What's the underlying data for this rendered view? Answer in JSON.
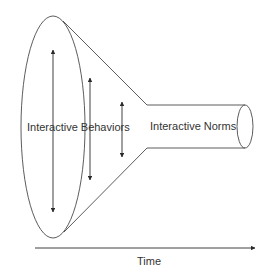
{
  "diagram": {
    "type": "funnel",
    "labels": {
      "wide_end": "Interactive Behaviors",
      "narrow_end": "Interactive Norms",
      "axis": "Time"
    },
    "arrows": {
      "count": 3,
      "direction": "bidirectional-vertical",
      "meaning": "variability decreasing over time"
    },
    "axis": {
      "direction": "left-to-right",
      "label": "Time"
    },
    "colors": {
      "stroke": "#4a4a4a",
      "text": "#333333",
      "background": "#ffffff"
    }
  }
}
